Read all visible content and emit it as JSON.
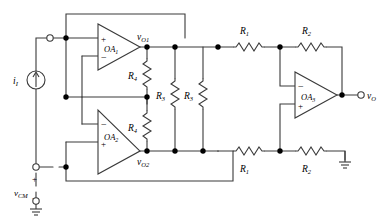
{
  "diagram": {
    "stroke_color": "#3a3a3a",
    "node_color": "#000000",
    "background": "#ffffff",
    "amplifiers": [
      {
        "id": "OA1",
        "label": "OA₁",
        "plus_on_top": true,
        "plus": "+",
        "minus": "−"
      },
      {
        "id": "OA2",
        "label": "OA₂",
        "plus_on_top": false,
        "plus": "+",
        "minus": "−"
      },
      {
        "id": "OA3",
        "label": "OA₃",
        "plus_on_top": false,
        "plus": "+",
        "minus": "−"
      }
    ],
    "resistors": [
      {
        "id": "R4a",
        "label": "R₄",
        "orientation": "vertical"
      },
      {
        "id": "R4b",
        "label": "R₄",
        "orientation": "vertical"
      },
      {
        "id": "R3a",
        "label": "R₃",
        "orientation": "vertical"
      },
      {
        "id": "R3b",
        "label": "R₃",
        "orientation": "vertical"
      },
      {
        "id": "R1top",
        "label": "R₁",
        "orientation": "horizontal"
      },
      {
        "id": "R2top",
        "label": "R₂",
        "orientation": "horizontal"
      },
      {
        "id": "R1bot",
        "label": "R₁",
        "orientation": "horizontal"
      },
      {
        "id": "R2bot",
        "label": "R₂",
        "orientation": "horizontal"
      }
    ],
    "sources": [
      {
        "id": "iI",
        "label": "i₁",
        "type": "current-source",
        "symbol": "arrow"
      },
      {
        "id": "vCM",
        "label": "vᴄᴍ",
        "type": "voltage-source",
        "plus": "+",
        "minus": "−"
      }
    ],
    "node_labels": [
      {
        "id": "vO1",
        "label": "vₒ₁"
      },
      {
        "id": "vO2",
        "label": "vₒ₂"
      },
      {
        "id": "vO",
        "label": "vₒ"
      }
    ],
    "terminals": [
      {
        "id": "input-terminal",
        "kind": "open-circle"
      },
      {
        "id": "vcm-terminal",
        "kind": "open-circle"
      },
      {
        "id": "vcm-return",
        "kind": "open-circle"
      },
      {
        "id": "output-terminal",
        "kind": "open-circle"
      }
    ],
    "grounds": [
      {
        "id": "gnd-vcm"
      },
      {
        "id": "gnd-r2bot"
      }
    ],
    "text": {
      "vCM": "v",
      "vCM_sub": "CM",
      "iI": "i",
      "iI_sub": "I",
      "vO1": "v",
      "vO1_sub": "O1",
      "vO2": "v",
      "vO2_sub": "O2",
      "vO": "v",
      "vO_sub": "O",
      "OA1": "OA",
      "OA1_sub": "1",
      "OA2": "OA",
      "OA2_sub": "2",
      "OA3": "OA",
      "OA3_sub": "3",
      "R1": "R",
      "R1_sub": "1",
      "R2": "R",
      "R2_sub": "2",
      "R3": "R",
      "R3_sub": "3",
      "R4": "R",
      "R4_sub": "4",
      "plus": "+",
      "minus": "−"
    }
  }
}
